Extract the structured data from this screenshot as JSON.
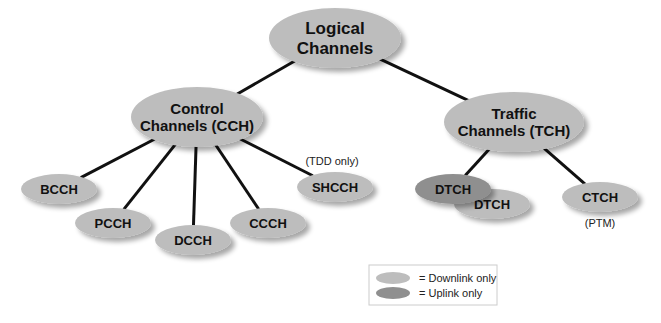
{
  "colors": {
    "downlink": "#bdbdbd",
    "uplink": "#8f8f8f",
    "edge": "#111111",
    "text": "#111111"
  },
  "nodes": {
    "logical": {
      "lines": [
        "Logical",
        "Channels"
      ],
      "kind": "downlink"
    },
    "cch": {
      "lines": [
        "Control",
        "Channels (CCH)"
      ],
      "kind": "downlink"
    },
    "tch": {
      "lines": [
        "Traffic",
        "Channels (TCH)"
      ],
      "kind": "downlink"
    },
    "bcch": {
      "lines": [
        "BCCH"
      ],
      "kind": "downlink"
    },
    "pcch": {
      "lines": [
        "PCCH"
      ],
      "kind": "downlink"
    },
    "dcch": {
      "lines": [
        "DCCH"
      ],
      "kind": "downlink"
    },
    "ccch": {
      "lines": [
        "CCCH"
      ],
      "kind": "downlink"
    },
    "shcch": {
      "lines": [
        "SHCCH"
      ],
      "kind": "downlink"
    },
    "dtch_down": {
      "lines": [
        "DTCH"
      ],
      "kind": "downlink"
    },
    "dtch_up": {
      "lines": [
        "DTCH"
      ],
      "kind": "uplink"
    },
    "ctch": {
      "lines": [
        "CTCH"
      ],
      "kind": "downlink"
    }
  },
  "notes": {
    "shcch": "(TDD only)",
    "ctch": "(PTM)"
  },
  "edges": [
    [
      "logical",
      "cch"
    ],
    [
      "logical",
      "tch"
    ],
    [
      "cch",
      "bcch"
    ],
    [
      "cch",
      "pcch"
    ],
    [
      "cch",
      "dcch"
    ],
    [
      "cch",
      "ccch"
    ],
    [
      "cch",
      "shcch"
    ],
    [
      "tch",
      "dtch_up"
    ],
    [
      "tch",
      "ctch"
    ]
  ],
  "legend": {
    "items": [
      {
        "kind": "downlink",
        "label": "= Downlink only"
      },
      {
        "kind": "uplink",
        "label": "= Uplink only"
      }
    ]
  }
}
